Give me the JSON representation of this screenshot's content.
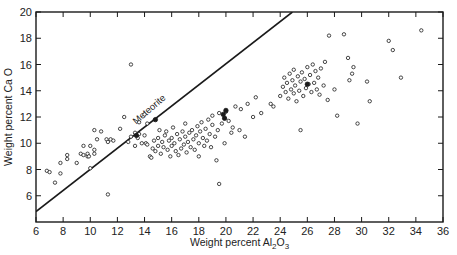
{
  "chart_data": {
    "type": "scatter",
    "title": "",
    "xlabel": "Weight percent Al2O3",
    "xlabel_main": "Weight percent Al",
    "xlabel_sub1": "2",
    "xlabel_mid": "O",
    "xlabel_sub2": "3",
    "ylabel": "Weight percent Ca O",
    "xlim": [
      6,
      36
    ],
    "ylim": [
      4,
      20
    ],
    "x_ticks": [
      6,
      8,
      10,
      12,
      14,
      16,
      18,
      20,
      22,
      24,
      26,
      28,
      30,
      32,
      34,
      36
    ],
    "y_ticks": [
      6,
      8,
      10,
      12,
      14,
      16,
      18,
      20
    ],
    "grid": false,
    "legend": null,
    "annotations": [
      {
        "text": "Meteorite",
        "type": "line-label",
        "x": 14.5,
        "y": 12.4,
        "rotation": -41
      }
    ],
    "reference_lines": [
      {
        "name": "Meteorite",
        "x": [
          6,
          24.9
        ],
        "y": [
          4.8,
          20
        ]
      }
    ],
    "series": [
      {
        "name": "open circles",
        "marker": "open-circle",
        "points": [
          [
            6.8,
            7.9
          ],
          [
            7.0,
            7.8
          ],
          [
            7.4,
            7.0
          ],
          [
            7.8,
            7.7
          ],
          [
            7.8,
            8.5
          ],
          [
            8.3,
            8.8
          ],
          [
            8.3,
            9.1
          ],
          [
            9.0,
            8.5
          ],
          [
            9.3,
            9.2
          ],
          [
            9.5,
            9.8
          ],
          [
            9.5,
            9.1
          ],
          [
            9.8,
            9.0
          ],
          [
            9.8,
            9.2
          ],
          [
            9.9,
            9.0
          ],
          [
            10.0,
            8.1
          ],
          [
            10.0,
            9.8
          ],
          [
            10.3,
            9.2
          ],
          [
            10.3,
            9.5
          ],
          [
            10.3,
            11.0
          ],
          [
            10.5,
            10.3
          ],
          [
            10.8,
            10.9
          ],
          [
            11.2,
            10.3
          ],
          [
            11.3,
            10.1
          ],
          [
            11.3,
            6.1
          ],
          [
            11.5,
            10.3
          ],
          [
            11.7,
            10.2
          ],
          [
            12.2,
            11.1
          ],
          [
            12.5,
            12.0
          ],
          [
            12.8,
            10.1
          ],
          [
            13.0,
            10.5
          ],
          [
            13.0,
            16.0
          ],
          [
            13.3,
            10.8
          ],
          [
            13.3,
            9.8
          ],
          [
            13.5,
            10.4
          ],
          [
            13.6,
            10.7
          ],
          [
            13.6,
            11.6
          ],
          [
            13.8,
            10.0
          ],
          [
            14.0,
            10.6
          ],
          [
            14.0,
            12.2
          ],
          [
            14.1,
            10.0
          ],
          [
            14.2,
            11.5
          ],
          [
            14.2,
            9.9
          ],
          [
            14.4,
            9.0
          ],
          [
            14.5,
            8.9
          ],
          [
            14.6,
            9.6
          ],
          [
            14.7,
            10.2
          ],
          [
            14.8,
            9.4
          ],
          [
            15.0,
            9.8
          ],
          [
            15.0,
            10.4
          ],
          [
            15.1,
            11.0
          ],
          [
            15.2,
            9.2
          ],
          [
            15.3,
            10.1
          ],
          [
            15.4,
            9.7
          ],
          [
            15.5,
            10.6
          ],
          [
            15.6,
            10.9
          ],
          [
            15.7,
            9.5
          ],
          [
            15.8,
            10.2
          ],
          [
            15.9,
            9.0
          ],
          [
            16.0,
            10.4
          ],
          [
            16.0,
            9.8
          ],
          [
            16.1,
            11.2
          ],
          [
            16.2,
            10.0
          ],
          [
            16.3,
            9.4
          ],
          [
            16.4,
            10.7
          ],
          [
            16.5,
            9.1
          ],
          [
            16.6,
            10.3
          ],
          [
            16.7,
            9.6
          ],
          [
            16.8,
            10.9
          ],
          [
            16.9,
            9.9
          ],
          [
            17.0,
            10.5
          ],
          [
            17.0,
            11.5
          ],
          [
            17.1,
            9.3
          ],
          [
            17.2,
            10.1
          ],
          [
            17.3,
            10.8
          ],
          [
            17.4,
            9.7
          ],
          [
            17.5,
            11.0
          ],
          [
            17.6,
            10.3
          ],
          [
            17.7,
            9.5
          ],
          [
            17.8,
            10.6
          ],
          [
            17.9,
            11.3
          ],
          [
            18.0,
            10.0
          ],
          [
            18.0,
            9.0
          ],
          [
            18.1,
            10.9
          ],
          [
            18.2,
            11.6
          ],
          [
            18.3,
            10.4
          ],
          [
            18.4,
            9.8
          ],
          [
            18.5,
            11.1
          ],
          [
            18.6,
            10.2
          ],
          [
            18.7,
            11.8
          ],
          [
            18.8,
            10.7
          ],
          [
            18.9,
            9.7
          ],
          [
            19.0,
            11.4
          ],
          [
            19.0,
            12.1
          ],
          [
            19.2,
            10.5
          ],
          [
            19.3,
            8.7
          ],
          [
            19.4,
            11.0
          ],
          [
            19.5,
            6.9
          ],
          [
            19.5,
            12.3
          ],
          [
            19.7,
            11.5
          ],
          [
            19.9,
            10.0
          ],
          [
            20.0,
            12.4
          ],
          [
            20.2,
            11.7
          ],
          [
            20.4,
            10.8
          ],
          [
            20.5,
            11.2
          ],
          [
            20.7,
            12.8
          ],
          [
            21.0,
            11.0
          ],
          [
            21.1,
            12.6
          ],
          [
            21.4,
            10.5
          ],
          [
            21.6,
            13.0
          ],
          [
            22.0,
            12.0
          ],
          [
            22.2,
            13.5
          ],
          [
            22.6,
            12.3
          ],
          [
            23.3,
            13.0
          ],
          [
            23.5,
            12.8
          ],
          [
            24.0,
            13.6
          ],
          [
            24.2,
            14.3
          ],
          [
            24.3,
            15.0
          ],
          [
            24.4,
            13.9
          ],
          [
            24.5,
            14.6
          ],
          [
            24.6,
            13.4
          ],
          [
            24.7,
            15.3
          ],
          [
            24.8,
            14.1
          ],
          [
            24.9,
            14.8
          ],
          [
            25.0,
            13.8
          ],
          [
            25.0,
            15.6
          ],
          [
            25.1,
            14.4
          ],
          [
            25.2,
            13.2
          ],
          [
            25.3,
            15.1
          ],
          [
            25.4,
            14.0
          ],
          [
            25.5,
            14.7
          ],
          [
            25.6,
            15.4
          ],
          [
            25.7,
            13.6
          ],
          [
            25.8,
            14.9
          ],
          [
            25.9,
            14.2
          ],
          [
            26.0,
            15.8
          ],
          [
            26.1,
            14.5
          ],
          [
            26.2,
            15.2
          ],
          [
            26.3,
            13.9
          ],
          [
            26.4,
            16.0
          ],
          [
            26.5,
            14.6
          ],
          [
            26.6,
            15.5
          ],
          [
            26.7,
            14.1
          ],
          [
            26.8,
            15.0
          ],
          [
            26.9,
            13.7
          ],
          [
            27.0,
            15.7
          ],
          [
            27.2,
            14.4
          ],
          [
            27.3,
            16.2
          ],
          [
            27.5,
            13.3
          ],
          [
            27.6,
            18.2
          ],
          [
            28.0,
            14.1
          ],
          [
            28.7,
            18.3
          ],
          [
            29.0,
            16.5
          ],
          [
            29.1,
            14.8
          ],
          [
            29.3,
            15.3
          ],
          [
            29.4,
            15.8
          ],
          [
            29.7,
            11.5
          ],
          [
            30.4,
            14.7
          ],
          [
            30.6,
            13.2
          ],
          [
            32.0,
            17.8
          ],
          [
            32.3,
            17.1
          ],
          [
            32.9,
            15.0
          ],
          [
            34.4,
            18.6
          ],
          [
            25.5,
            11.0
          ],
          [
            28.2,
            12.1
          ]
        ]
      },
      {
        "name": "filled circles",
        "marker": "filled-circle",
        "points": [
          [
            13.4,
            10.6
          ],
          [
            14.8,
            11.8
          ],
          [
            19.8,
            12.2
          ],
          [
            20.0,
            12.5
          ],
          [
            19.9,
            11.9
          ],
          [
            26.0,
            14.5
          ]
        ]
      }
    ]
  },
  "labels": {
    "meteorite": "Meteorite"
  },
  "colors": {
    "ink": "#1a1a1a",
    "background": "#ffffff"
  }
}
